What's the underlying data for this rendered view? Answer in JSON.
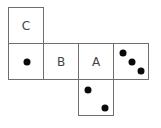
{
  "diagram": {
    "faces": [
      {
        "id": "C",
        "label": "C",
        "type": "letter"
      },
      {
        "id": "one-dot",
        "label": "",
        "type": "dots",
        "dots": 1
      },
      {
        "id": "B",
        "label": "B",
        "type": "letter"
      },
      {
        "id": "A",
        "label": "A",
        "type": "letter"
      },
      {
        "id": "three-dots",
        "label": "",
        "type": "dots",
        "dots": 3
      },
      {
        "id": "two-dots",
        "label": "",
        "type": "dots",
        "dots": 2
      }
    ],
    "colors": {
      "border": "#6e6e6e",
      "dot": "#0a0a0a",
      "text": "#444444",
      "background": "#ffffff"
    }
  }
}
